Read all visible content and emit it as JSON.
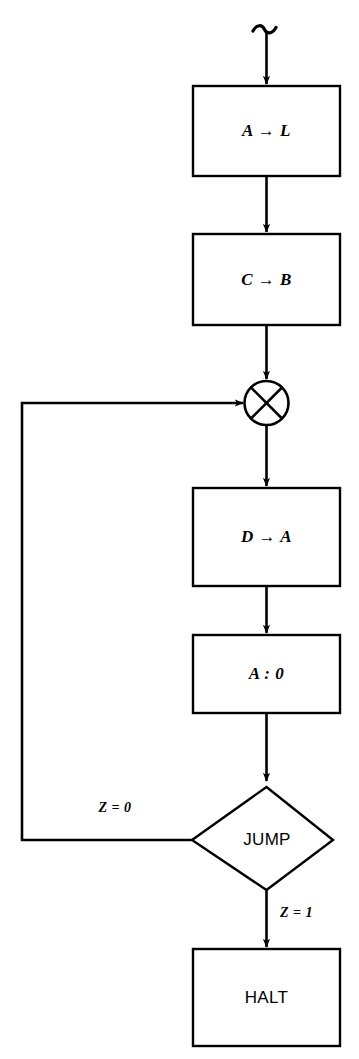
{
  "diagram": {
    "type": "flowchart",
    "title": "",
    "canvas": {
      "width": 359,
      "height": 1059,
      "background": "#ffffff"
    },
    "stroke_color": "#000000",
    "nodes": [
      {
        "id": "entry",
        "name": "entry-squiggle",
        "shape": "squiggle",
        "label": "",
        "cx": 267,
        "cy": 38
      },
      {
        "id": "assign-a-l",
        "name": "process-a-to-l",
        "shape": "rectangle",
        "label": "A → L",
        "x": 193,
        "y": 86,
        "w": 147,
        "h": 90
      },
      {
        "id": "assign-c-b",
        "name": "process-c-to-b",
        "shape": "rectangle",
        "label": "C → B",
        "x": 193,
        "y": 234,
        "w": 147,
        "h": 91
      },
      {
        "id": "junction",
        "name": "merge-junction",
        "shape": "circle-cross",
        "label": "",
        "cx": 267,
        "cy": 403,
        "r": 22
      },
      {
        "id": "assign-d-a",
        "name": "process-d-to-a",
        "shape": "rectangle",
        "label": "D → A",
        "x": 193,
        "y": 488,
        "w": 147,
        "h": 98
      },
      {
        "id": "compare-a-0",
        "name": "process-compare-a-zero",
        "shape": "rectangle",
        "label": "A : 0",
        "x": 193,
        "y": 635,
        "w": 147,
        "h": 78
      },
      {
        "id": "jump",
        "name": "decision-jump",
        "shape": "diamond",
        "label": "JUMP",
        "cx": 267,
        "cy": 840,
        "hw": 70,
        "hh": 53
      },
      {
        "id": "halt",
        "name": "terminal-halt",
        "shape": "rectangle",
        "label": "HALT",
        "x": 193,
        "y": 949,
        "w": 147,
        "h": 97
      }
    ],
    "edges": [
      {
        "id": "e-entry-al",
        "from": "entry",
        "to": "assign-a-l",
        "label": "",
        "arrow": true
      },
      {
        "id": "e-al-cb",
        "from": "assign-a-l",
        "to": "assign-c-b",
        "label": "",
        "arrow": true
      },
      {
        "id": "e-cb-junction",
        "from": "assign-c-b",
        "to": "junction",
        "label": "",
        "arrow": true
      },
      {
        "id": "e-junction-da",
        "from": "junction",
        "to": "assign-d-a",
        "label": "",
        "arrow": true
      },
      {
        "id": "e-da-cmp",
        "from": "assign-d-a",
        "to": "compare-a-0",
        "label": "",
        "arrow": true
      },
      {
        "id": "e-cmp-jump",
        "from": "compare-a-0",
        "to": "jump",
        "label": "",
        "arrow": true
      },
      {
        "id": "e-jump-loop",
        "from": "jump",
        "to": "junction",
        "label": "Z = 0",
        "arrow": true
      },
      {
        "id": "e-jump-halt",
        "from": "jump",
        "to": "halt",
        "label": "Z = 1",
        "arrow": true
      }
    ],
    "edge_labels": {
      "z_zero": "Z = 0",
      "z_one": "Z = 1"
    }
  }
}
